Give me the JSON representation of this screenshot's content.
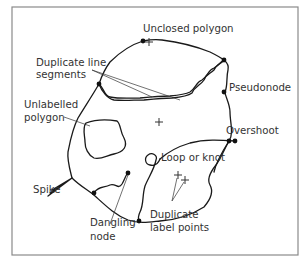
{
  "diagram": {
    "labels": {
      "unclosed_polygon": "Unclosed polygon",
      "duplicate_line_segments_1": "Duplicate line",
      "duplicate_line_segments_2": "segments",
      "pseudonode": "Pseudonode",
      "unlabelled_polygon_1": "Unlabelled",
      "unlabelled_polygon_2": "polygon",
      "overshoot": "Overshoot",
      "loop_or_knot": "Loop or knot",
      "spike": "Spike",
      "dangling_node_1": "Dangling",
      "dangling_node_2": "node",
      "duplicate_label_points_1": "Duplicate",
      "duplicate_label_points_2": "label points"
    },
    "label_markers": [
      "+",
      "+",
      "+",
      "+"
    ],
    "colors": {
      "line": "#1a1a1a",
      "text": "#333333",
      "frame": "#8a8a8a",
      "background": "#ffffff"
    }
  }
}
